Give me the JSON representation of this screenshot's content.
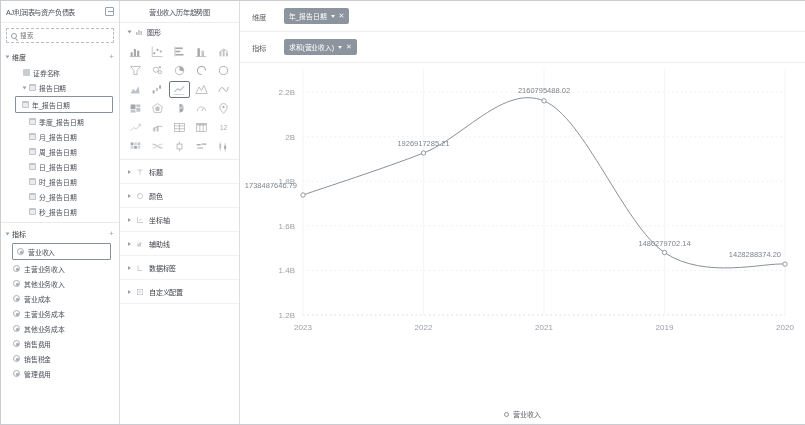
{
  "data_panel": {
    "title": "AJ利润表与资产负债表",
    "switch_icon": "switch-dataset-icon",
    "search": {
      "placeholder": "搜索",
      "value": "",
      "icon": "search-icon"
    },
    "dimension_section": {
      "label": "维度",
      "add_label": "+"
    },
    "dimension_items": [
      {
        "label": "证券名称",
        "icon": "text-field-icon",
        "level": "sub",
        "selected": false
      },
      {
        "label": "报告日期",
        "icon": "date-field-icon",
        "level": "sub",
        "selected": false,
        "expandable": true
      },
      {
        "label": "年_报告日期",
        "icon": "date-field-icon",
        "level": "subsub",
        "selected": true
      },
      {
        "label": "季度_报告日期",
        "icon": "date-field-icon",
        "level": "subsub",
        "selected": false
      },
      {
        "label": "月_报告日期",
        "icon": "date-field-icon",
        "level": "subsub",
        "selected": false
      },
      {
        "label": "周_报告日期",
        "icon": "date-field-icon",
        "level": "subsub",
        "selected": false
      },
      {
        "label": "日_报告日期",
        "icon": "date-field-icon",
        "level": "subsub",
        "selected": false
      },
      {
        "label": "时_报告日期",
        "icon": "date-field-icon",
        "level": "subsub",
        "selected": false
      },
      {
        "label": "分_报告日期",
        "icon": "date-field-icon",
        "level": "subsub",
        "selected": false
      },
      {
        "label": "秒_报告日期",
        "icon": "date-field-icon",
        "level": "subsub",
        "selected": false
      }
    ],
    "metric_section": {
      "label": "指标",
      "add_label": "+"
    },
    "metric_items": [
      {
        "label": "营业收入",
        "selected": true
      },
      {
        "label": "主营业务收入",
        "selected": false
      },
      {
        "label": "其他业务收入",
        "selected": false
      },
      {
        "label": "营业成本",
        "selected": false
      },
      {
        "label": "主营业务成本",
        "selected": false
      },
      {
        "label": "其他业务成本",
        "selected": false
      },
      {
        "label": "销售费用",
        "selected": false
      },
      {
        "label": "销售税金",
        "selected": false
      },
      {
        "label": "管理费用",
        "selected": false
      }
    ]
  },
  "style_panel": {
    "title": "营业收入历年趋势图",
    "chart_type_section": {
      "label": "图形",
      "caret": "chevron-down-icon",
      "icon": "chart-type-icon"
    },
    "chart_types": [
      {
        "name": "bar-chart-icon",
        "selected": false
      },
      {
        "name": "scatter-chart-icon",
        "selected": false
      },
      {
        "name": "horizontal-bar-chart-icon",
        "selected": false
      },
      {
        "name": "stacked-bar-chart-icon",
        "selected": false
      },
      {
        "name": "column-line-chart-icon",
        "selected": false
      },
      {
        "name": "funnel-chart-icon",
        "selected": false
      },
      {
        "name": "bubble-chart-icon",
        "selected": false
      },
      {
        "name": "pie-chart-icon",
        "selected": false
      },
      {
        "name": "donut-progress-icon",
        "selected": false
      },
      {
        "name": "ring-chart-icon",
        "selected": false
      },
      {
        "name": "area-chart-icon",
        "selected": false
      },
      {
        "name": "waterfall-chart-icon",
        "selected": false
      },
      {
        "name": "line-chart-icon",
        "selected": true
      },
      {
        "name": "mountain-chart-icon",
        "selected": false
      },
      {
        "name": "curve-chart-icon",
        "selected": false
      },
      {
        "name": "treemap-chart-icon",
        "selected": false
      },
      {
        "name": "radar-chart-icon",
        "selected": false
      },
      {
        "name": "rose-chart-icon",
        "selected": false
      },
      {
        "name": "gauge-chart-icon",
        "selected": false
      },
      {
        "name": "map-point-icon",
        "selected": false
      },
      {
        "name": "trend-chart-icon",
        "selected": false
      },
      {
        "name": "dual-axis-chart-icon",
        "selected": false
      },
      {
        "name": "table-chart-icon",
        "selected": false
      },
      {
        "name": "pivot-table-icon",
        "selected": false
      },
      {
        "name": "number-card-icon",
        "selected": false
      },
      {
        "name": "heatmap-chart-icon",
        "selected": false
      },
      {
        "name": "sankey-chart-icon",
        "selected": false
      },
      {
        "name": "box-chart-icon",
        "selected": false
      },
      {
        "name": "word-cloud-icon",
        "selected": false
      },
      {
        "name": "candlestick-chart-icon",
        "selected": false
      }
    ],
    "accordion": [
      {
        "label": "标题",
        "icon": "title-icon",
        "caret": "chevron-right-icon"
      },
      {
        "label": "颜色",
        "icon": "palette-icon",
        "caret": "chevron-right-icon"
      },
      {
        "label": "坐标轴",
        "icon": "axis-icon",
        "caret": "chevron-right-icon"
      },
      {
        "label": "辅助线",
        "icon": "reference-line-icon",
        "caret": "chevron-right-icon"
      },
      {
        "label": "数据标签",
        "icon": "data-label-icon",
        "caret": "chevron-right-icon"
      },
      {
        "label": "自定义配置",
        "icon": "custom-config-icon",
        "caret": "chevron-right-icon"
      }
    ]
  },
  "shelves": [
    {
      "label": "维度",
      "pill": {
        "text": "年_报告日期",
        "dropdown_icon": "chevron-down-icon",
        "remove_icon": "close-icon"
      }
    },
    {
      "label": "指标",
      "pill": {
        "text": "求和(营业收入)",
        "dropdown_icon": "chevron-down-icon",
        "remove_icon": "close-icon"
      }
    }
  ],
  "chart_data": {
    "type": "line",
    "title": "",
    "xlabel": "",
    "ylabel": "",
    "grid": true,
    "legend_position": "bottom",
    "series": [
      {
        "name": "营业收入",
        "color": "#8a9099",
        "values": [
          1738487646.79,
          1926917285.21,
          2160795488.02,
          1480279702.14,
          1428288374.2
        ],
        "labels": [
          "1738487646.79",
          "1926917285.21",
          "2160795488.02",
          "1480279702.14",
          "1428288374.20"
        ]
      }
    ],
    "categories": [
      "2023",
      "2022",
      "2021",
      "2019",
      "2020"
    ],
    "ytick_labels": [
      "2.2B",
      "2B",
      "1.8B",
      "1.6B",
      "1.4B",
      "1.2B"
    ],
    "ytick_values": [
      2200000000,
      2000000000,
      1800000000,
      1600000000,
      1400000000,
      1200000000
    ],
    "ylim": [
      1200000000,
      2250000000
    ],
    "legend": [
      "营业收入"
    ]
  }
}
